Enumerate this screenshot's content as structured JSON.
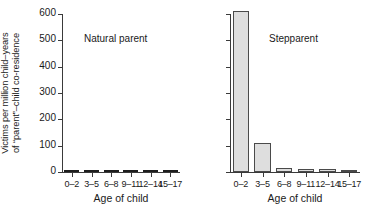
{
  "chart_data": {
    "type": "bar",
    "title": "",
    "xlabel": "Age of child",
    "ylabel_line1": "Victims per million child–years",
    "ylabel_line2": "of “parent”–child co-residence",
    "categories": [
      "0–2",
      "3–5",
      "6–8",
      "9–11",
      "12–14",
      "15–17"
    ],
    "ylim": [
      0,
      600
    ],
    "yticks": [
      0,
      100,
      200,
      300,
      400,
      500,
      600
    ],
    "ytick_labels": [
      "0",
      "100",
      "200",
      "300",
      "400",
      "500",
      "600"
    ],
    "grid": false,
    "legend": "none",
    "panels": [
      {
        "name": "natural-parent",
        "title": "Natural parent",
        "bar_color": "#1d1d1d",
        "values": [
          6,
          5,
          4,
          0.6,
          0.5,
          0.4
        ]
      },
      {
        "name": "stepparent",
        "title": "Stepparent",
        "bar_color": "#dedede",
        "bar_edge_color": "#4a4a4a",
        "values": [
          610,
          112,
          16,
          11,
          11,
          8
        ]
      }
    ]
  },
  "figure": {
    "background": "#ffffff",
    "axis_color": "#3a3a3a",
    "text_color": "#1a1a1a"
  }
}
